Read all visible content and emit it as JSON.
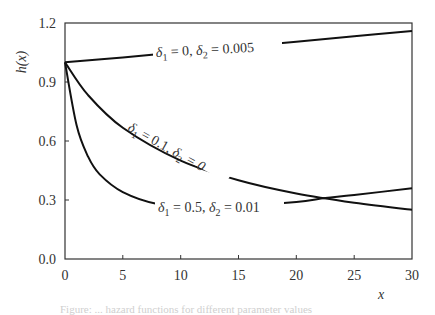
{
  "chart_data": {
    "type": "line",
    "title": "",
    "xlabel": "x",
    "ylabel": "h(x)",
    "xlim": [
      0,
      30
    ],
    "ylim": [
      0.0,
      1.2
    ],
    "xticks": [
      "0",
      "5",
      "10",
      "15",
      "20",
      "25",
      "30"
    ],
    "yticks": [
      "0.0",
      "0.3",
      "0.6",
      "0.9",
      "1.2"
    ],
    "grid": false,
    "legend": "inline labels on curves",
    "series": [
      {
        "name": "δ1 = 0, δ2 = 0.005",
        "x": [
          0,
          5,
          10,
          15,
          20,
          25,
          30
        ],
        "values": [
          1.0,
          1.025,
          1.051,
          1.078,
          1.105,
          1.133,
          1.16
        ]
      },
      {
        "name": "δ1 = 0.1, δ2 = 0",
        "x": [
          0,
          2,
          5,
          10,
          15,
          20,
          25,
          30
        ],
        "values": [
          1.0,
          0.833,
          0.667,
          0.5,
          0.4,
          0.333,
          0.286,
          0.25
        ]
      },
      {
        "name": "δ1 = 0.5, δ2 = 0.01",
        "x": [
          0,
          1,
          2,
          3,
          5,
          8,
          12,
          15,
          20,
          22.5,
          25,
          30
        ],
        "values": [
          1.0,
          0.68,
          0.52,
          0.43,
          0.34,
          0.28,
          0.265,
          0.27,
          0.29,
          0.31,
          0.325,
          0.36
        ]
      }
    ]
  },
  "labels": {
    "y_axis": "h(x)",
    "x_axis": "x",
    "curve1": {
      "d1": "δ",
      "s1": "1",
      "t1": " = 0, ",
      "d2": "δ",
      "s2": "2",
      "t2": " = 0.005"
    },
    "curve2": {
      "d1": "δ",
      "s1": "1",
      "t1": " = 0.1, ",
      "d2": "δ",
      "s2": "2",
      "t2": " = 0"
    },
    "curve3": {
      "d1": "δ",
      "s1": "1",
      "t1": " = 0.5, ",
      "d2": "δ",
      "s2": "2",
      "t2": " = 0.01"
    }
  },
  "caption": "Figure: ... hazard functions for different parameter values"
}
